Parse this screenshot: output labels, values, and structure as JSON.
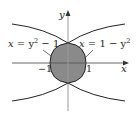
{
  "figure": {
    "axes": {
      "x_label": "x",
      "y_label": "y",
      "tick_left": "−1",
      "tick_right": "1"
    },
    "curves": [
      {
        "name": "left-parabola",
        "equation": "x = y² − 1"
      },
      {
        "name": "right-parabola",
        "equation": "x = 1 − y²"
      }
    ],
    "labels": {
      "left_eq_x": "x",
      "left_eq_rest": " = y",
      "left_eq_exp": "2",
      "left_eq_tail": " − 1",
      "right_eq_x": "x",
      "right_eq_rest": " = 1 − y",
      "right_eq_exp": "2"
    },
    "colors": {
      "region_fill": "#8a8a8a",
      "curve": "#222222",
      "axis": "#999999"
    }
  }
}
